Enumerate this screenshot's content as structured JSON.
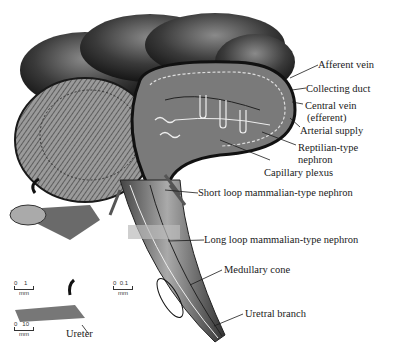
{
  "labels": {
    "afferent_vein": "Afferent vein",
    "collecting_duct": "Collecting duct",
    "central_vein_1": "Central vein",
    "central_vein_2": "(efferent)",
    "arterial_supply": "Arterial supply",
    "reptilian_1": "Reptilian-type",
    "reptilian_2": "nephron",
    "capillary_plexus": "Capillary plexus",
    "short_loop": "Short loop mammalian-type nephron",
    "long_loop": "Long loop mammalian-type nephron",
    "medullary_cone": "Medullary cone",
    "uretral_branch": "Uretral branch",
    "ureter": "Ureter"
  },
  "scales": [
    {
      "min": "0",
      "max": "1",
      "unit": "mm"
    },
    {
      "min": "0",
      "max": "0.1",
      "unit": "mm"
    },
    {
      "min": "0",
      "max": "10",
      "unit": "mm"
    }
  ],
  "colors": {
    "ink": "#1a1a1a",
    "tissue_dark": "#2a2a2a",
    "tissue_mid": "#6b6b6b",
    "tissue_light": "#bdbdbd"
  }
}
